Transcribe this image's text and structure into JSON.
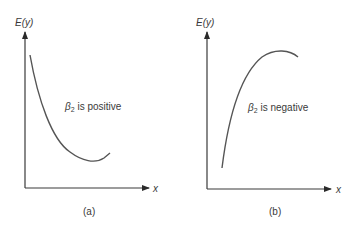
{
  "panels": [
    {
      "id": "a",
      "y_axis_label": "E(y)",
      "x_axis_label": "x",
      "annotation_symbol": "β",
      "annotation_sub": "2",
      "annotation_text": " is positive",
      "caption": "(a)",
      "curve": "convex (U-shaped, opens upward)"
    },
    {
      "id": "b",
      "y_axis_label": "E(y)",
      "x_axis_label": "x",
      "annotation_symbol": "β",
      "annotation_sub": "2",
      "annotation_text": " is negative",
      "caption": "(b)",
      "curve": "concave (inverted U, opens downward)"
    }
  ],
  "colors": {
    "line": "#555555",
    "text": "#3a3a3a",
    "background": "#ffffff"
  }
}
